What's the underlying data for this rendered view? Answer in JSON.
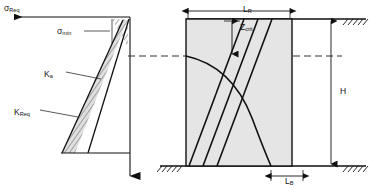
{
  "figure": {
    "colors": {
      "line": "#111111",
      "block_fill": "#e3e3e3",
      "wedge_fill": "#d9d9d9",
      "dashed": "#333333",
      "background": "#ffffff"
    },
    "left_diagram": {
      "name": "stress-distribution-plot",
      "axis_horizontal_label": "σ",
      "axis_horizontal_sub": "Req",
      "labels": [
        {
          "base": "σ",
          "sub": "Req",
          "name": "sigma-req-label"
        },
        {
          "base": "σ",
          "sub": "min",
          "name": "sigma-min-label"
        },
        {
          "base": "K",
          "sub": "a",
          "name": "ka-label"
        },
        {
          "base": "K",
          "sub": "Req",
          "name": "kreq-label"
        }
      ]
    },
    "right_diagram": {
      "name": "reinforced-soil-block",
      "labels": [
        {
          "base": "Z",
          "sub": "crit",
          "name": "zcrit-label"
        },
        {
          "base": "L",
          "sub": "R",
          "name": "lr-label"
        },
        {
          "base": "H",
          "sub": "",
          "name": "h-label"
        },
        {
          "base": "L",
          "sub": "B",
          "name": "lb-label"
        }
      ]
    }
  }
}
